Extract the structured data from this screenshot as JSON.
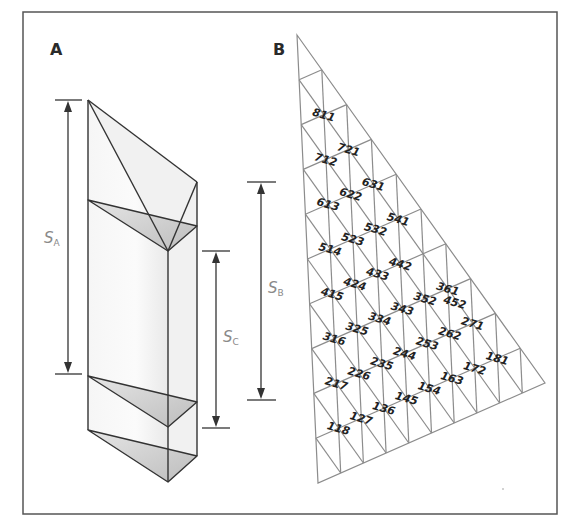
{
  "figure": {
    "panels": [
      {
        "id": "A",
        "label": "A"
      },
      {
        "id": "B",
        "label": "B"
      }
    ],
    "dimensions": [
      {
        "id": "SA",
        "symbol": "S",
        "subscript": "A"
      },
      {
        "id": "SB",
        "symbol": "S",
        "subscript": "B"
      },
      {
        "id": "SC",
        "symbol": "S",
        "subscript": "C"
      }
    ],
    "grid": {
      "divisions": 10,
      "vertices": {
        "apex": [
          297,
          35
        ],
        "right": [
          545,
          383
        ],
        "bottom_left": [
          318,
          483
        ]
      },
      "labels": [
        "811",
        "721",
        "712",
        "631",
        "622",
        "613",
        "541",
        "532",
        "523",
        "514",
        "452",
        "442",
        "433",
        "424",
        "415",
        "361",
        "352",
        "343",
        "334",
        "325",
        "316",
        "271",
        "262",
        "253",
        "244",
        "235",
        "226",
        "217",
        "181",
        "172",
        "163",
        "154",
        "145",
        "136",
        "127",
        "118"
      ]
    },
    "colors": {
      "frame": "#555555",
      "prism_stroke": "#333333",
      "grid_stroke": "#8c8c8c",
      "shade_dark": "#c8c8c8",
      "shade_light": "#ececec"
    }
  }
}
